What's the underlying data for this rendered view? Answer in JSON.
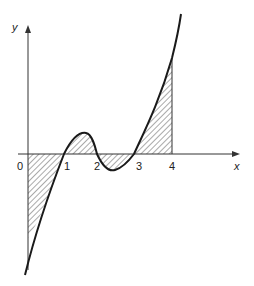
{
  "axes": {
    "x_label": "x",
    "y_label": "y",
    "origin_label": "0"
  },
  "ticks": [
    "1",
    "2",
    "3",
    "4"
  ],
  "colors": {
    "line": "#1a1a1a",
    "hatch": "#555555"
  }
}
